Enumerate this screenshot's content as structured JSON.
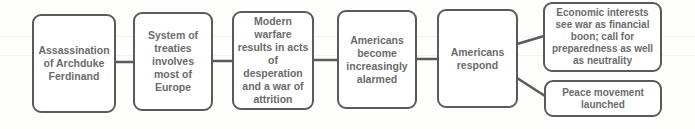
{
  "diagram": {
    "type": "flowchart",
    "colors": {
      "border": "#5a5a5a",
      "text": "#6b6b6b",
      "background": "#fdfdfc"
    },
    "nodes": [
      {
        "id": "n1",
        "label": "Assassination of Archduke Ferdinand"
      },
      {
        "id": "n2",
        "label": "System of treaties involves most of Europe"
      },
      {
        "id": "n3",
        "label": "Modern warfare results in acts of desperation and a war of attrition"
      },
      {
        "id": "n4",
        "label": "Americans become increasingly alarmed"
      },
      {
        "id": "n5",
        "label": "Americans respond"
      },
      {
        "id": "n6",
        "label": "Economic interests see war as financial boon; call for preparedness as well as neutrality"
      },
      {
        "id": "n7",
        "label": "Peace movement launched"
      }
    ],
    "edges": [
      {
        "from": "n1",
        "to": "n2"
      },
      {
        "from": "n2",
        "to": "n3"
      },
      {
        "from": "n3",
        "to": "n4"
      },
      {
        "from": "n4",
        "to": "n5"
      },
      {
        "from": "n5",
        "to": "n6"
      },
      {
        "from": "n5",
        "to": "n7"
      }
    ]
  }
}
